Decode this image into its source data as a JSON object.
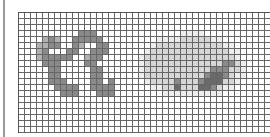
{
  "image": {
    "description": "Pixel-grid bitmap with two glyph panels",
    "grid": {
      "cols": 42,
      "rows": 20,
      "cell_px": 6
    },
    "palette": {
      "0": "#ffffff",
      "1": "#ededed",
      "2": "#d6d6d6",
      "3": "#b0b0b0",
      "4": "#8a8a8a",
      "5": "#6a6a6a"
    },
    "rows": [
      "000000000000000000000000000000000000000000",
      "000000000000000000000000000000000000000000",
      "000000000000000000000000000000000000000000",
      "000000000044400000000000000111100000000000",
      "000034300444440000000001111222221100000000",
      "000334400430044000000012222222222211000000",
      "000340004400444000000122222222222221100000",
      "000344444003440000001222222222222222100000",
      "000044400004400000001222222222222244210000",
      "000004400000440000001222222222224442210000",
      "000004400000440000001222222222245542110000",
      "000004440000440400000122224222455522100000",
      "000000444400444400000011225222554211000000",
      "000000044400044400000000111111111100000000",
      "000000000000000000000000000000000000000000",
      "000000000000000000000000000000000000000000",
      "000000000000000000000000000000000000000000",
      "000000000000000000000000000000000000000000",
      "000000000000000000000000000000000000000000",
      "000000000000000000000000000000000000000000"
    ]
  }
}
